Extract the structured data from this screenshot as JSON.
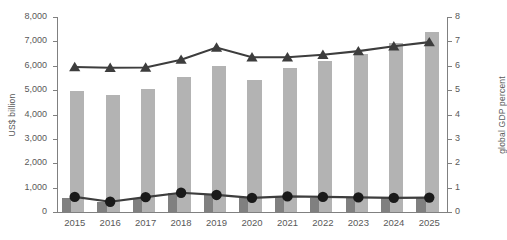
{
  "chart_data": {
    "type": "bar",
    "title": "",
    "categories": [
      "2015",
      "2016",
      "2017",
      "2018",
      "2019",
      "2020",
      "2021",
      "2022",
      "2023",
      "2024",
      "2025"
    ],
    "xlabel": "",
    "ylabel": "US$ billion",
    "ylabel_right": "global GDP percent",
    "ylim": [
      0,
      8000
    ],
    "ylim_right": [
      0,
      8
    ],
    "yticks": [
      0,
      1000,
      2000,
      3000,
      4000,
      5000,
      6000,
      7000,
      8000
    ],
    "ytick_labels": [
      "0",
      "1,000",
      "2,000",
      "3,000",
      "4,000",
      "5,000",
      "6,000",
      "7,000",
      "8,000"
    ],
    "yticks_right": [
      0,
      1,
      2,
      3,
      4,
      5,
      6,
      7,
      8
    ],
    "ytick_labels_right": [
      "0",
      "1",
      "2",
      "3",
      "4",
      "5",
      "6",
      "7",
      "8"
    ],
    "grid": false,
    "legend": "none",
    "series": [
      {
        "name": "Total value (US$ billion)",
        "type": "bar",
        "axis": "left",
        "color": "#b3b3b3",
        "values": [
          4950,
          4820,
          5050,
          5550,
          6000,
          5400,
          5900,
          6200,
          6500,
          6950,
          7400
        ]
      },
      {
        "name": "Secondary value (US$ billion)",
        "type": "bar",
        "axis": "left",
        "color": "#808080",
        "values": [
          560,
          420,
          560,
          760,
          690,
          560,
          620,
          590,
          560,
          560,
          560
        ]
      },
      {
        "name": "Share of global GDP (percent)",
        "type": "line",
        "axis": "right",
        "marker": "triangle",
        "color": "#3d3d3d",
        "values": [
          5.95,
          5.92,
          5.93,
          6.25,
          6.75,
          6.35,
          6.35,
          6.45,
          6.6,
          6.8,
          6.97
        ]
      },
      {
        "name": "Secondary line (US$ billion)",
        "type": "line",
        "axis": "left",
        "marker": "circle",
        "color": "#1a1a1a",
        "values": [
          620,
          420,
          610,
          790,
          700,
          580,
          640,
          620,
          600,
          580,
          590
        ]
      }
    ]
  },
  "axes": {
    "left_title": "US$ billion",
    "right_title": "global GDP percent"
  }
}
